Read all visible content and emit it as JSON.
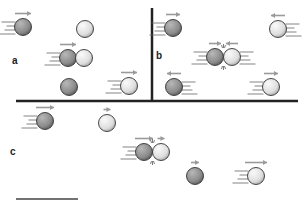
{
  "labels": {
    "a": {
      "text": "a",
      "x": 12,
      "y": 55
    },
    "b": {
      "text": "b",
      "x": 156,
      "y": 50
    },
    "c": {
      "text": "c",
      "x": 10,
      "y": 146
    }
  },
  "colors": {
    "dark_ball": "#8e8e8e",
    "light_ball": "#e4e4e4",
    "ball_outline": "#333333",
    "arrow": "#9a9a9a",
    "speed_line": "#666666",
    "divider": "#222222"
  },
  "dividers": [
    {
      "x1": 16,
      "y1": 101,
      "x2": 298,
      "y2": 101,
      "w": 2.5
    },
    {
      "x1": 152,
      "y1": 8,
      "x2": 152,
      "y2": 101,
      "w": 2.5
    }
  ],
  "scale_bar": {
    "x1": 16,
    "y1": 199,
    "x2": 78,
    "y2": 199,
    "w": 1.5
  },
  "balls": [
    {
      "panel": "a",
      "x": 23,
      "y": 27,
      "shade": "dark",
      "arrow": "right",
      "arrow_len": 16,
      "trail": "left"
    },
    {
      "panel": "a",
      "x": 85,
      "y": 29,
      "shade": "light",
      "arrow": null,
      "trail": null
    },
    {
      "panel": "a",
      "x": 68,
      "y": 58,
      "shade": "dark",
      "arrow": "right",
      "arrow_len": 16,
      "trail": "left"
    },
    {
      "panel": "a",
      "x": 84,
      "y": 58,
      "shade": "light",
      "arrow": null,
      "trail": null
    },
    {
      "panel": "a",
      "x": 69,
      "y": 87,
      "shade": "dark",
      "arrow": null,
      "trail": null
    },
    {
      "panel": "a",
      "x": 129,
      "y": 86,
      "shade": "light",
      "arrow": "right",
      "arrow_len": 16,
      "trail": "left"
    },
    {
      "panel": "b",
      "x": 173,
      "y": 28,
      "shade": "dark",
      "arrow": "right",
      "arrow_len": 14,
      "trail": "left"
    },
    {
      "panel": "b",
      "x": 278,
      "y": 29,
      "shade": "light",
      "arrow": "left",
      "arrow_len": 14,
      "trail": "right"
    },
    {
      "panel": "b",
      "x": 215,
      "y": 57,
      "shade": "dark",
      "arrow": "right",
      "arrow_len": 12,
      "trail": "left",
      "collision": true
    },
    {
      "panel": "b",
      "x": 232,
      "y": 57,
      "shade": "light",
      "arrow": "left",
      "arrow_len": 12,
      "trail": "right"
    },
    {
      "panel": "b",
      "x": 174,
      "y": 87,
      "shade": "dark",
      "arrow": "left",
      "arrow_len": 14,
      "trail": "right"
    },
    {
      "panel": "b",
      "x": 271,
      "y": 87,
      "shade": "light",
      "arrow": "right",
      "arrow_len": 14,
      "trail": "left"
    },
    {
      "panel": "c",
      "x": 45,
      "y": 121,
      "shade": "dark",
      "arrow": "right",
      "arrow_len": 18,
      "trail": "left"
    },
    {
      "panel": "c",
      "x": 107,
      "y": 123,
      "shade": "light",
      "arrow": "right",
      "arrow_len": 7,
      "trail": null
    },
    {
      "panel": "c",
      "x": 144,
      "y": 152,
      "shade": "dark",
      "arrow": "right",
      "arrow_len": 18,
      "trail": "left",
      "collision": true
    },
    {
      "panel": "c",
      "x": 161,
      "y": 152,
      "shade": "light",
      "arrow": "right",
      "arrow_len": 7,
      "trail": null
    },
    {
      "panel": "c",
      "x": 195,
      "y": 176,
      "shade": "dark",
      "arrow": "right",
      "arrow_len": 8,
      "trail": null
    },
    {
      "panel": "c",
      "x": 256,
      "y": 176,
      "shade": "light",
      "arrow": "right",
      "arrow_len": 22,
      "trail": "left"
    }
  ]
}
